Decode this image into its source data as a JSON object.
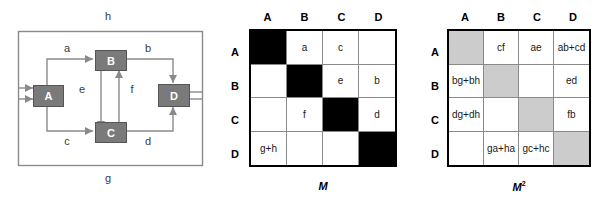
{
  "graph": {
    "nodes": [
      {
        "id": "A",
        "label": "A"
      },
      {
        "id": "B",
        "label": "B"
      },
      {
        "id": "C",
        "label": "C"
      },
      {
        "id": "D",
        "label": "D"
      }
    ],
    "edge_labels": {
      "a": "a",
      "b": "b",
      "c": "c",
      "d": "d",
      "e": "e",
      "f": "f",
      "g": "g",
      "h": "h"
    },
    "node_fill": "#7a7a7a",
    "line_color": "#8a8a8a"
  },
  "matrix_m": {
    "caption": "M",
    "column_headers": [
      "A",
      "B",
      "C",
      "D"
    ],
    "row_headers": [
      "A",
      "B",
      "C",
      "D"
    ],
    "cells": [
      [
        {
          "text": "",
          "fill": "black"
        },
        {
          "text": "a",
          "fill": "none"
        },
        {
          "text": "c",
          "fill": "none"
        },
        {
          "text": "",
          "fill": "none"
        }
      ],
      [
        {
          "text": "",
          "fill": "none"
        },
        {
          "text": "",
          "fill": "black"
        },
        {
          "text": "e",
          "fill": "none"
        },
        {
          "text": "b",
          "fill": "none"
        }
      ],
      [
        {
          "text": "",
          "fill": "none"
        },
        {
          "text": "f",
          "fill": "none"
        },
        {
          "text": "",
          "fill": "black"
        },
        {
          "text": "d",
          "fill": "none"
        }
      ],
      [
        {
          "text": "g+h",
          "fill": "none"
        },
        {
          "text": "",
          "fill": "none"
        },
        {
          "text": "",
          "fill": "none"
        },
        {
          "text": "",
          "fill": "black"
        }
      ]
    ]
  },
  "matrix_m2": {
    "caption": "M",
    "caption_exponent": "2",
    "column_headers": [
      "A",
      "B",
      "C",
      "D"
    ],
    "row_headers": [
      "A",
      "B",
      "C",
      "D"
    ],
    "cells": [
      [
        {
          "text": "",
          "fill": "gray"
        },
        {
          "text": "cf",
          "fill": "none"
        },
        {
          "text": "ae",
          "fill": "none"
        },
        {
          "text": "ab+cd",
          "fill": "none"
        }
      ],
      [
        {
          "text": "bg+bh",
          "fill": "none"
        },
        {
          "text": "ef",
          "fill": "gray"
        },
        {
          "text": "",
          "fill": "none"
        },
        {
          "text": "ed",
          "fill": "none"
        }
      ],
      [
        {
          "text": "dg+dh",
          "fill": "none"
        },
        {
          "text": "",
          "fill": "none"
        },
        {
          "text": "fe",
          "fill": "gray"
        },
        {
          "text": "fb",
          "fill": "none"
        }
      ],
      [
        {
          "text": "",
          "fill": "none"
        },
        {
          "text": "ga+ha",
          "fill": "none"
        },
        {
          "text": "gc+hc",
          "fill": "none"
        },
        {
          "text": "",
          "fill": "gray"
        }
      ]
    ]
  }
}
